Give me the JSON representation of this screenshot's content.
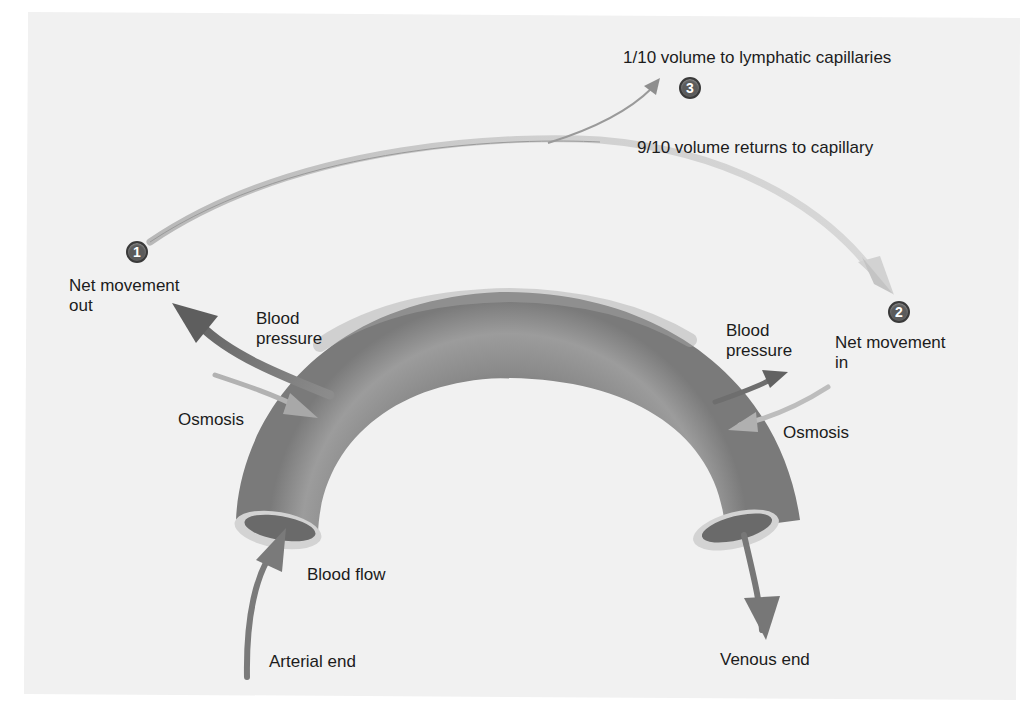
{
  "diagram": {
    "steps": [
      {
        "number": "1",
        "label_line1": "Net movement",
        "label_line2": "out"
      },
      {
        "number": "2",
        "label_line1": "Net movement",
        "label_line2": "in"
      },
      {
        "number": "3",
        "label": "1/10 volume to lymphatic capillaries"
      }
    ],
    "return_label": "9/10 volume returns to capillary",
    "arterial_side": {
      "blood_pressure_line1": "Blood",
      "blood_pressure_line2": "pressure",
      "osmosis": "Osmosis",
      "blood_flow": "Blood flow",
      "end_label": "Arterial end"
    },
    "venous_side": {
      "blood_pressure_line1": "Blood",
      "blood_pressure_line2": "pressure",
      "osmosis": "Osmosis",
      "end_label": "Venous end"
    },
    "colors": {
      "background": "#f1f1f1",
      "vessel": "#8a8a8a",
      "vessel_rim": "#d6d6d6",
      "arrow_dark": "#6a6a6a",
      "arrow_light": "#c4c4c4",
      "badge": "#5b5b5b"
    }
  }
}
